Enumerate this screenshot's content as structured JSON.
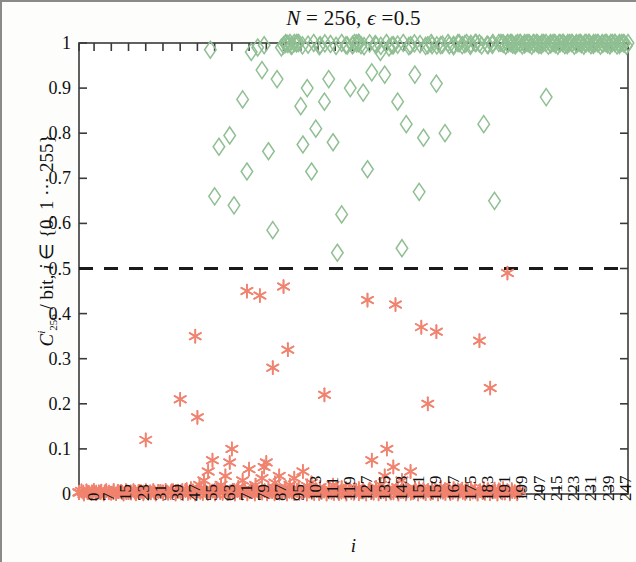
{
  "figure": {
    "width": 636,
    "height": 562,
    "background": "#fdfdfc"
  },
  "title": {
    "full": "N = 256, ϵ =0.5",
    "n_symbol": "N",
    "equals": " = ",
    "n_value": "256",
    "comma": ", ",
    "epsilon_symbol": "ϵ",
    "epsilon_equals": " =",
    "epsilon_value": "0.5"
  },
  "axes": {
    "xlabel": "i",
    "ylabel_parts": {
      "c": "C",
      "superscript": "i",
      "subscript": "256",
      "unit": "/ bit,",
      "index_var": "i",
      "member": "∈",
      "set": "{0, 1 ⋯ 255}"
    },
    "ylabel_full": "C^i_256 / bit, i ∈ {0, 1⋯255}",
    "xlim": [
      0,
      255
    ],
    "ylim": [
      0,
      1
    ],
    "grid": false,
    "box": true,
    "ytick_values": [
      0,
      0.1,
      0.2,
      0.3,
      0.4,
      0.5,
      0.6,
      0.7,
      0.8,
      0.9,
      1
    ],
    "ytick_labels": [
      "0",
      "0.1",
      "0.2",
      "0.3",
      "0.4",
      "0.5",
      "0.6",
      "0.7",
      "0.8",
      "0.9",
      "1"
    ],
    "xtick_values": [
      0,
      7,
      15,
      23,
      31,
      39,
      47,
      55,
      63,
      71,
      79,
      87,
      95,
      103,
      111,
      119,
      127,
      135,
      143,
      151,
      159,
      167,
      175,
      183,
      191,
      199,
      207,
      215,
      223,
      231,
      239,
      247,
      255
    ],
    "xtick_labels": [
      "0",
      "7",
      "15",
      "23",
      "31",
      "39",
      "47",
      "55",
      "63",
      "71",
      "79",
      "87",
      "95",
      "103",
      "111",
      "119",
      "127",
      "135",
      "143",
      "151",
      "159",
      "167",
      "175",
      "183",
      "191",
      "199",
      "207",
      "215",
      "223",
      "231",
      "239",
      "247",
      "255"
    ]
  },
  "colors": {
    "diamond": "#8fbf92",
    "asterisk": "#f0836f",
    "threshold_line": "#1a1a1a",
    "axis": "#3a3a3a",
    "text": "#111111"
  },
  "chart_data": {
    "type": "scatter",
    "title": "N = 256, ϵ =0.5",
    "xlabel": "i",
    "ylabel": "C^i_256 / bit, i ∈ {0, 1⋯255}",
    "xlim": [
      0,
      255
    ],
    "ylim": [
      0,
      1
    ],
    "grid": false,
    "legend": "none",
    "annotations": [
      {
        "type": "hline",
        "y": 0.5,
        "style": "dashed",
        "color": "#1a1a1a",
        "label": "0.5 threshold"
      }
    ],
    "series": [
      {
        "name": "upper branch",
        "marker": "diamond-open",
        "color": "#8fbf92",
        "points": [
          [
            61,
            0.985
          ],
          [
            63,
            0.66
          ],
          [
            65,
            0.77
          ],
          [
            70,
            0.795
          ],
          [
            72,
            0.64
          ],
          [
            76,
            0.875
          ],
          [
            78,
            0.715
          ],
          [
            80,
            0.98
          ],
          [
            83,
            0.99
          ],
          [
            85,
            0.94
          ],
          [
            86,
            0.995
          ],
          [
            88,
            0.76
          ],
          [
            90,
            0.585
          ],
          [
            92,
            0.92
          ],
          [
            94,
            0.99
          ],
          [
            95,
            0.995
          ],
          [
            96,
            1.0
          ],
          [
            97,
            0.998
          ],
          [
            98,
            1.0
          ],
          [
            99,
            0.995
          ],
          [
            100,
            1.0
          ],
          [
            101,
            0.999
          ],
          [
            102,
            1.0
          ],
          [
            103,
            0.86
          ],
          [
            104,
            0.775
          ],
          [
            106,
            0.9
          ],
          [
            108,
            0.715
          ],
          [
            110,
            0.81
          ],
          [
            112,
            0.995
          ],
          [
            114,
            0.87
          ],
          [
            116,
            0.92
          ],
          [
            118,
            0.78
          ],
          [
            120,
            0.535
          ],
          [
            122,
            0.62
          ],
          [
            124,
            0.995
          ],
          [
            126,
            0.9
          ],
          [
            127,
            0.995
          ],
          [
            128,
            1.0
          ],
          [
            129,
            0.999
          ],
          [
            130,
            1.0
          ],
          [
            131,
            0.995
          ],
          [
            132,
            0.89
          ],
          [
            134,
            0.72
          ],
          [
            136,
            0.935
          ],
          [
            138,
            0.995
          ],
          [
            140,
            0.98
          ],
          [
            142,
            0.93
          ],
          [
            144,
            0.99
          ],
          [
            146,
            0.995
          ],
          [
            148,
            0.87
          ],
          [
            150,
            0.545
          ],
          [
            152,
            0.82
          ],
          [
            154,
            0.995
          ],
          [
            156,
            0.93
          ],
          [
            158,
            0.67
          ],
          [
            160,
            0.79
          ],
          [
            162,
            0.995
          ],
          [
            164,
            0.995
          ],
          [
            166,
            0.91
          ],
          [
            168,
            0.995
          ],
          [
            170,
            0.8
          ],
          [
            172,
            0.995
          ],
          [
            174,
            0.996
          ],
          [
            176,
            1.0
          ],
          [
            178,
            0.995
          ],
          [
            180,
            1.0
          ],
          [
            182,
            0.998
          ],
          [
            184,
            1.0
          ],
          [
            186,
            0.999
          ],
          [
            188,
            0.82
          ],
          [
            190,
            0.995
          ],
          [
            192,
            0.996
          ],
          [
            193,
            0.65
          ],
          [
            195,
            1.0
          ],
          [
            197,
            0.999
          ],
          [
            199,
            1.0
          ],
          [
            201,
            1.0
          ],
          [
            203,
            0.998
          ],
          [
            205,
            1.0
          ],
          [
            207,
            1.0
          ],
          [
            209,
            1.0
          ],
          [
            211,
            1.0
          ],
          [
            213,
            0.999
          ],
          [
            215,
            1.0
          ],
          [
            217,
            0.88
          ],
          [
            219,
            1.0
          ],
          [
            221,
            1.0
          ],
          [
            223,
            1.0
          ],
          [
            225,
            1.0
          ],
          [
            227,
            1.0
          ],
          [
            229,
            1.0
          ],
          [
            231,
            1.0
          ],
          [
            233,
            1.0
          ],
          [
            235,
            1.0
          ],
          [
            237,
            1.0
          ],
          [
            239,
            1.0
          ],
          [
            241,
            1.0
          ],
          [
            243,
            1.0
          ],
          [
            245,
            1.0
          ],
          [
            247,
            1.0
          ],
          [
            249,
            1.0
          ],
          [
            251,
            1.0
          ],
          [
            253,
            1.0
          ],
          [
            255,
            1.0
          ]
        ]
      },
      {
        "name": "lower branch",
        "marker": "asterisk",
        "color": "#f0836f",
        "points": [
          [
            0,
            0.003
          ],
          [
            2,
            0.004
          ],
          [
            4,
            0.003
          ],
          [
            6,
            0.005
          ],
          [
            8,
            0.004
          ],
          [
            10,
            0.003
          ],
          [
            12,
            0.005
          ],
          [
            14,
            0.004
          ],
          [
            16,
            0.003
          ],
          [
            18,
            0.006
          ],
          [
            20,
            0.004
          ],
          [
            22,
            0.003
          ],
          [
            24,
            0.005
          ],
          [
            26,
            0.004
          ],
          [
            28,
            0.006
          ],
          [
            30,
            0.004
          ],
          [
            31,
            0.12
          ],
          [
            33,
            0.005
          ],
          [
            35,
            0.004
          ],
          [
            37,
            0.006
          ],
          [
            39,
            0.005
          ],
          [
            41,
            0.004
          ],
          [
            43,
            0.007
          ],
          [
            45,
            0.006
          ],
          [
            47,
            0.21
          ],
          [
            48,
            0.008
          ],
          [
            50,
            0.01
          ],
          [
            52,
            0.012
          ],
          [
            54,
            0.35
          ],
          [
            55,
            0.17
          ],
          [
            56,
            0.02
          ],
          [
            58,
            0.03
          ],
          [
            60,
            0.05
          ],
          [
            62,
            0.075
          ],
          [
            63,
            0.008
          ],
          [
            64,
            0.012
          ],
          [
            66,
            0.02
          ],
          [
            68,
            0.04
          ],
          [
            70,
            0.07
          ],
          [
            71,
            0.1
          ],
          [
            72,
            0.008
          ],
          [
            74,
            0.015
          ],
          [
            76,
            0.03
          ],
          [
            78,
            0.45
          ],
          [
            79,
            0.055
          ],
          [
            80,
            0.01
          ],
          [
            82,
            0.02
          ],
          [
            84,
            0.44
          ],
          [
            85,
            0.035
          ],
          [
            86,
            0.06
          ],
          [
            87,
            0.07
          ],
          [
            88,
            0.012
          ],
          [
            90,
            0.28
          ],
          [
            91,
            0.025
          ],
          [
            93,
            0.04
          ],
          [
            95,
            0.46
          ],
          [
            96,
            0.015
          ],
          [
            97,
            0.32
          ],
          [
            98,
            0.02
          ],
          [
            100,
            0.035
          ],
          [
            102,
            0.012
          ],
          [
            104,
            0.05
          ],
          [
            106,
            0.018
          ],
          [
            108,
            0.025
          ],
          [
            110,
            0.01
          ],
          [
            112,
            0.015
          ],
          [
            114,
            0.22
          ],
          [
            116,
            0.012
          ],
          [
            118,
            0.02
          ],
          [
            120,
            0.01
          ],
          [
            122,
            0.014
          ],
          [
            124,
            0.012
          ],
          [
            126,
            0.008
          ],
          [
            128,
            0.01
          ],
          [
            130,
            0.012
          ],
          [
            132,
            0.009
          ],
          [
            134,
            0.43
          ],
          [
            135,
            0.011
          ],
          [
            136,
            0.075
          ],
          [
            138,
            0.015
          ],
          [
            140,
            0.02
          ],
          [
            142,
            0.04
          ],
          [
            143,
            0.1
          ],
          [
            144,
            0.012
          ],
          [
            146,
            0.06
          ],
          [
            147,
            0.42
          ],
          [
            148,
            0.015
          ],
          [
            150,
            0.03
          ],
          [
            152,
            0.01
          ],
          [
            154,
            0.05
          ],
          [
            156,
            0.013
          ],
          [
            158,
            0.012
          ],
          [
            159,
            0.37
          ],
          [
            160,
            0.01
          ],
          [
            162,
            0.2
          ],
          [
            164,
            0.012
          ],
          [
            166,
            0.36
          ],
          [
            168,
            0.015
          ],
          [
            170,
            0.01
          ],
          [
            172,
            0.013
          ],
          [
            174,
            0.012
          ],
          [
            176,
            0.009
          ],
          [
            178,
            0.011
          ],
          [
            180,
            0.01
          ],
          [
            182,
            0.013
          ],
          [
            184,
            0.009
          ],
          [
            186,
            0.34
          ],
          [
            188,
            0.012
          ],
          [
            190,
            0.01
          ],
          [
            191,
            0.235
          ],
          [
            193,
            0.011
          ],
          [
            195,
            0.009
          ],
          [
            197,
            0.012
          ],
          [
            199,
            0.49
          ],
          [
            201,
            0.01
          ]
        ]
      }
    ]
  }
}
